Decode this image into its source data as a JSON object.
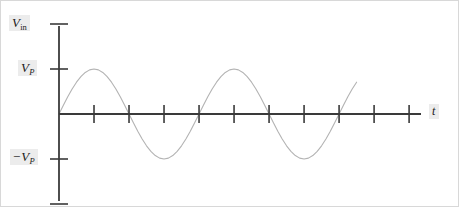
{
  "figure": {
    "kind": "waveform-plot",
    "background_color": "#ffffff",
    "border_color": "#d8d8d8"
  },
  "labels": {
    "y_axis_top": "V",
    "y_axis_top_sub": "in",
    "y_peak_positive": "V",
    "y_peak_positive_sub": "P",
    "y_peak_negative_sign": "−",
    "y_peak_negative": "V",
    "y_peak_negative_sub": "P",
    "x_axis": "t"
  },
  "chart_data": {
    "type": "line",
    "title": "",
    "xlabel": "t",
    "ylabel": "V_in",
    "grid": false,
    "legend": null,
    "curve_color": "#b3b3b3",
    "axis_color": "#3a3a3a",
    "x_tick_labels": [],
    "y_tick_labels": [
      "V_P",
      "-V_P"
    ],
    "xlim": [
      0,
      10.34
    ],
    "ylim": [
      -1.96,
      1.96
    ],
    "amplitude": 1,
    "period": 4,
    "cycles": 2.125,
    "waveform": "sine",
    "x": [
      0,
      0.125,
      0.25,
      0.375,
      0.5,
      0.625,
      0.75,
      0.875,
      1,
      1.125,
      1.25,
      1.375,
      1.5,
      1.625,
      1.75,
      1.875,
      2,
      2.125,
      2.25,
      2.375,
      2.5,
      2.625,
      2.75,
      2.875,
      3,
      3.125,
      3.25,
      3.375,
      3.5,
      3.625,
      3.75,
      3.875,
      4,
      4.125,
      4.25,
      4.375,
      4.5,
      4.625,
      4.75,
      4.875,
      5,
      5.125,
      5.25,
      5.375,
      5.5,
      5.625,
      5.75,
      5.875,
      6,
      6.125,
      6.25,
      6.375,
      6.5,
      6.625,
      6.75,
      6.875,
      7,
      7.125,
      7.25,
      7.375,
      7.5,
      7.625,
      7.75,
      7.875,
      8,
      8.125,
      8.25,
      8.375,
      8.5
    ],
    "y": [
      0,
      0.195,
      0.383,
      0.556,
      0.707,
      0.831,
      0.924,
      0.981,
      1,
      0.981,
      0.924,
      0.831,
      0.707,
      0.556,
      0.383,
      0.195,
      0,
      -0.195,
      -0.383,
      -0.556,
      -0.707,
      -0.831,
      -0.924,
      -0.981,
      -1,
      -0.981,
      -0.924,
      -0.831,
      -0.707,
      -0.556,
      -0.383,
      -0.195,
      0,
      0.195,
      0.383,
      0.556,
      0.707,
      0.831,
      0.924,
      0.981,
      1,
      0.981,
      0.924,
      0.831,
      0.707,
      0.556,
      0.383,
      0.195,
      0,
      -0.195,
      -0.383,
      -0.556,
      -0.707,
      -0.831,
      -0.924,
      -0.981,
      -1,
      -0.981,
      -0.924,
      -0.831,
      -0.707,
      -0.556,
      -0.383,
      -0.195,
      0,
      0.195,
      0.383,
      0.556,
      0.707
    ],
    "x_ticks": [
      1,
      2,
      3,
      4,
      5,
      6,
      7,
      8,
      9,
      10
    ],
    "y_ticks": [
      -2,
      -1,
      1,
      2
    ],
    "x_axis_origin_px": 58,
    "y_axis_origin_px": 113
  }
}
